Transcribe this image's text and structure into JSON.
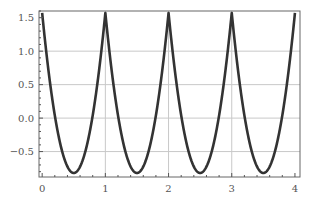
{
  "chart_data": {
    "type": "line",
    "title": "",
    "xlabel": "",
    "ylabel": "",
    "xlim": [
      -0.05,
      4.08
    ],
    "ylim": [
      -0.88,
      1.6
    ],
    "grid": true,
    "legend": null,
    "x_ticks": [
      0,
      1,
      2,
      3,
      4
    ],
    "x_tick_labels": [
      "0",
      "1",
      "2",
      "3",
      "4"
    ],
    "y_ticks": [
      1.5,
      1.0,
      0.5,
      0.0,
      -0.5
    ],
    "y_tick_labels": [
      "1.5",
      "1.0",
      "0.5",
      "0.0",
      "−0.5"
    ],
    "x_grid": [
      1,
      2,
      3
    ],
    "y_grid": [
      1.0,
      0.5,
      0.0,
      -0.5
    ],
    "series": [
      {
        "name": "f(x)",
        "color": "#333333",
        "description": "periodic with period 1; sharp peaks of ~1.571 at integer x, rounded minima of ~-0.82 at half-integers",
        "x": [
          0,
          0.1,
          0.2,
          0.3,
          0.4,
          0.5,
          0.6,
          0.7,
          0.8,
          0.9,
          1.0,
          1.1,
          1.2,
          1.3,
          1.4,
          1.5,
          1.6,
          1.7,
          1.8,
          1.9,
          2.0,
          2.1,
          2.2,
          2.3,
          2.4,
          2.5,
          2.6,
          2.7,
          2.8,
          2.9,
          3.0,
          3.1,
          3.2,
          3.3,
          3.4,
          3.5,
          3.6,
          3.7,
          3.8,
          3.9,
          4.0
        ],
        "y": [
          1.571,
          0.7,
          0.04,
          -0.43,
          -0.72,
          -0.82,
          -0.72,
          -0.43,
          0.04,
          0.7,
          1.571,
          0.7,
          0.04,
          -0.43,
          -0.72,
          -0.82,
          -0.72,
          -0.43,
          0.04,
          0.7,
          1.571,
          0.7,
          0.04,
          -0.43,
          -0.72,
          -0.82,
          -0.72,
          -0.43,
          0.04,
          0.7,
          1.571,
          0.7,
          0.04,
          -0.43,
          -0.72,
          -0.82,
          -0.72,
          -0.43,
          0.04,
          0.7,
          1.571
        ],
        "peak_value": 1.571,
        "min_value": -0.82,
        "period": 1
      }
    ]
  }
}
